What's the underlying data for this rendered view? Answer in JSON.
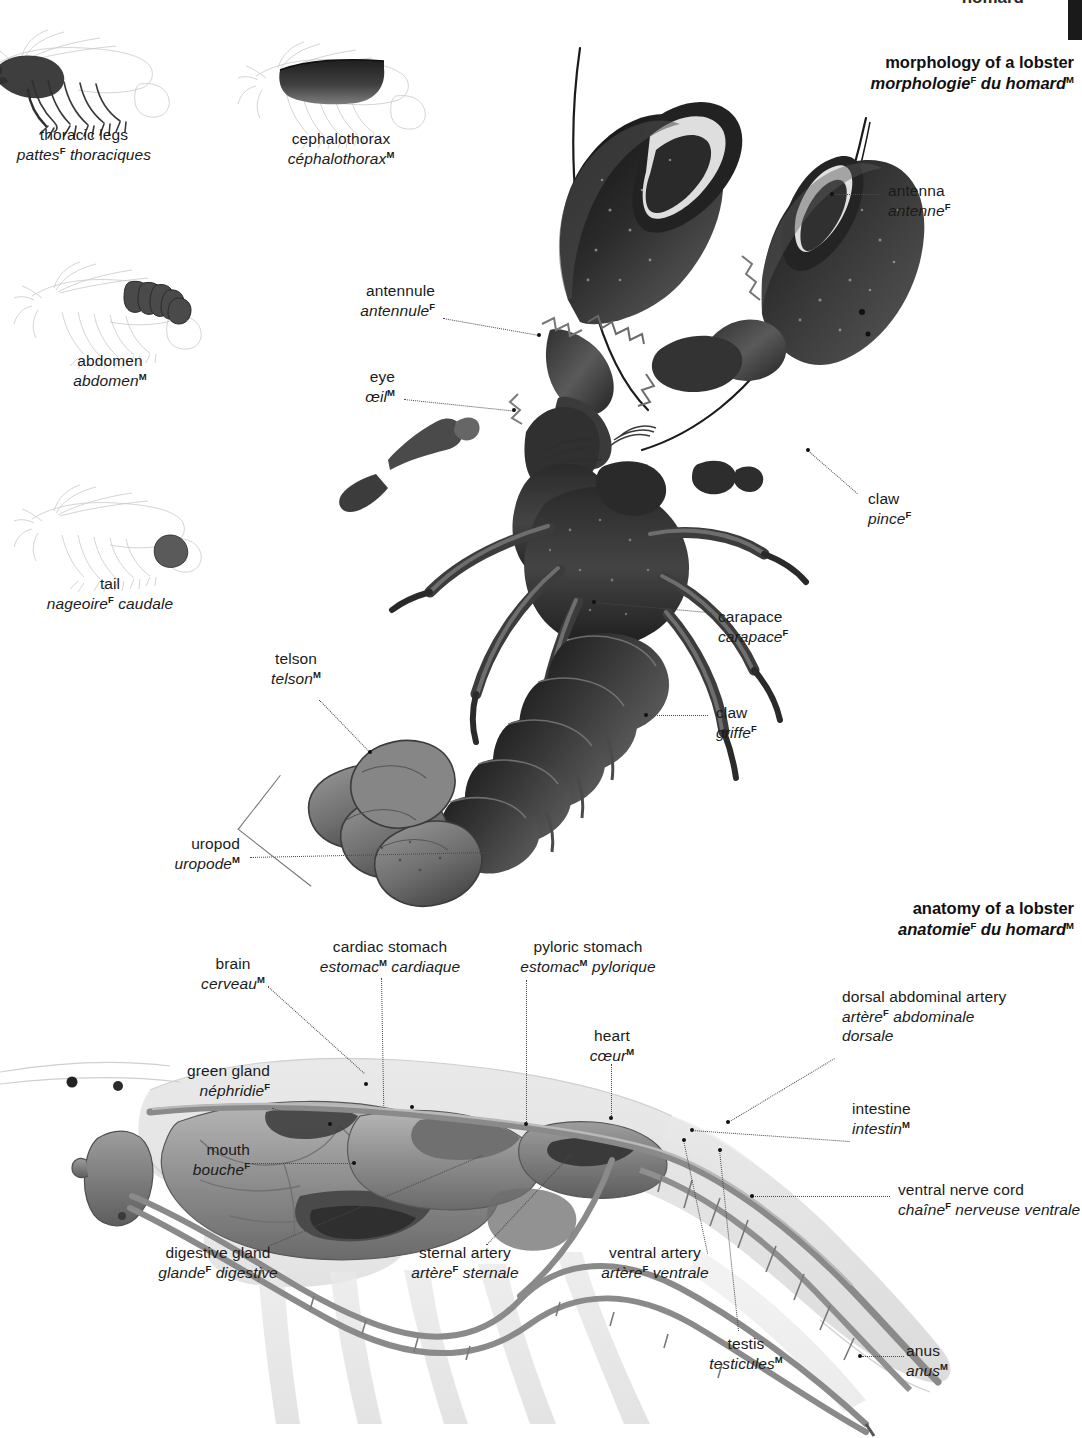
{
  "page": {
    "running_header": "homard",
    "background": "#ffffff",
    "ink": "#1b1b1b"
  },
  "headings": [
    {
      "id": "morphology",
      "en": "morphology of a lobster",
      "fr_pre": "morphologie",
      "fr_gender1": "F",
      "fr_mid": " du homard",
      "fr_gender2": "M"
    },
    {
      "id": "anatomy",
      "en": "anatomy of a lobster",
      "fr_pre": "anatomie",
      "fr_gender1": "F",
      "fr_mid": " du homard",
      "fr_gender2": "M"
    }
  ],
  "thumbnails": [
    {
      "id": "thoracic-legs",
      "en": "thoracic legs",
      "fr": "pattes",
      "fr_gender": "F",
      "fr_rest": " thoraciques",
      "highlight": "legs"
    },
    {
      "id": "cephalothorax",
      "en": "cephalothorax",
      "fr": "céphalothorax",
      "fr_gender": "M",
      "fr_rest": "",
      "highlight": "carapace"
    },
    {
      "id": "abdomen",
      "en": "abdomen",
      "fr": "abdomen",
      "fr_gender": "M",
      "fr_rest": "",
      "highlight": "abdomen"
    },
    {
      "id": "tail",
      "en": "tail",
      "fr": "nageoire",
      "fr_gender": "F",
      "fr_rest": " caudale",
      "highlight": "tail"
    }
  ],
  "morphology_labels": [
    {
      "id": "antennule",
      "en": "antennule",
      "fr": "antennule",
      "fr_gender": "F",
      "fr_rest": ""
    },
    {
      "id": "eye",
      "en": "eye",
      "fr": "œil",
      "fr_gender": "M",
      "fr_rest": ""
    },
    {
      "id": "antenna",
      "en": "antenna",
      "fr": "antenne",
      "fr_gender": "F",
      "fr_rest": ""
    },
    {
      "id": "claw-pince",
      "en": "claw",
      "fr": "pince",
      "fr_gender": "F",
      "fr_rest": ""
    },
    {
      "id": "carapace",
      "en": "carapace",
      "fr": "carapace",
      "fr_gender": "F",
      "fr_rest": ""
    },
    {
      "id": "claw-griffe",
      "en": "claw",
      "fr": "griffe",
      "fr_gender": "F",
      "fr_rest": ""
    },
    {
      "id": "telson",
      "en": "telson",
      "fr": "telson",
      "fr_gender": "M",
      "fr_rest": ""
    },
    {
      "id": "uropod",
      "en": "uropod",
      "fr": "uropode",
      "fr_gender": "M",
      "fr_rest": ""
    }
  ],
  "anatomy_labels": [
    {
      "id": "brain",
      "en": "brain",
      "fr": "cerveau",
      "fr_gender": "M",
      "fr_rest": ""
    },
    {
      "id": "cardiac-stomach",
      "en": "cardiac stomach",
      "fr": "estomac",
      "fr_gender": "M",
      "fr_rest": " cardiaque"
    },
    {
      "id": "pyloric-stomach",
      "en": "pyloric stomach",
      "fr": "estomac",
      "fr_gender": "M",
      "fr_rest": " pylorique"
    },
    {
      "id": "heart",
      "en": "heart",
      "fr": "cœur",
      "fr_gender": "M",
      "fr_rest": ""
    },
    {
      "id": "dorsal-abdominal-artery",
      "en": "dorsal abdominal artery",
      "fr": "artère",
      "fr_gender": "F",
      "fr_rest": " abdominale",
      "fr_line2": "dorsale"
    },
    {
      "id": "intestine",
      "en": "intestine",
      "fr": "intestin",
      "fr_gender": "M",
      "fr_rest": ""
    },
    {
      "id": "ventral-nerve-cord",
      "en": "ventral nerve cord",
      "fr": "chaîne",
      "fr_gender": "F",
      "fr_rest": " nerveuse ventrale"
    },
    {
      "id": "green-gland",
      "en": "green gland",
      "fr": "néphridie",
      "fr_gender": "F",
      "fr_rest": ""
    },
    {
      "id": "mouth",
      "en": "mouth",
      "fr": "bouche",
      "fr_gender": "F",
      "fr_rest": ""
    },
    {
      "id": "digestive-gland",
      "en": "digestive gland",
      "fr": "glande",
      "fr_gender": "F",
      "fr_rest": " digestive"
    },
    {
      "id": "sternal-artery",
      "en": "sternal artery",
      "fr": "artère",
      "fr_gender": "F",
      "fr_rest": " sternale"
    },
    {
      "id": "ventral-artery",
      "en": "ventral artery",
      "fr": "artère",
      "fr_gender": "F",
      "fr_rest": " ventrale"
    },
    {
      "id": "testis",
      "en": "testis",
      "fr": "testicules",
      "fr_gender": "M",
      "fr_rest": ""
    },
    {
      "id": "anus",
      "en": "anus",
      "fr": "anus",
      "fr_gender": "M",
      "fr_rest": ""
    }
  ]
}
